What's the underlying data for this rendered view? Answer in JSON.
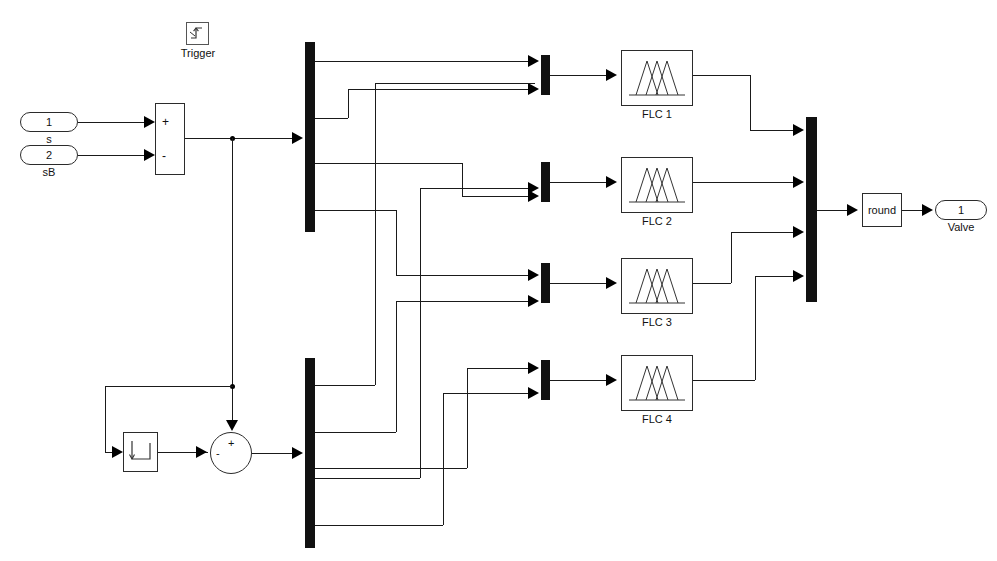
{
  "diagram": {
    "kind": "simulink-block-diagram",
    "title_fragment": "",
    "background": "#ffffff",
    "line_color": "#1a1a1a",
    "block_border": "#2b2b2b",
    "bar_color": "#111111"
  },
  "ports": {
    "inputs": [
      {
        "number": "1",
        "label": "s",
        "x": 20,
        "y": 112,
        "w": 58,
        "h": 20
      },
      {
        "number": "2",
        "label": "sB",
        "x": 20,
        "y": 145,
        "w": 58,
        "h": 20
      }
    ],
    "outputs": [
      {
        "number": "1",
        "label": "Valve",
        "x": 935,
        "y": 203,
        "w": 52,
        "h": 20
      }
    ]
  },
  "blocks": {
    "trigger": {
      "label": "Trigger",
      "x": 186,
      "y": 22,
      "w": 23,
      "h": 23
    },
    "sum_rect": {
      "x": 155,
      "y": 103,
      "w": 30,
      "h": 72,
      "signs": [
        "+",
        "-"
      ]
    },
    "unit_delay": {
      "x": 123,
      "y": 432,
      "w": 35,
      "h": 40,
      "icon": "unit-delay-icon"
    },
    "sum_circle": {
      "x": 210,
      "y": 432,
      "w": 42,
      "h": 42,
      "signs": [
        "+",
        "-"
      ]
    },
    "round": {
      "label": "round",
      "x": 862,
      "y": 193,
      "w": 40,
      "h": 34
    },
    "flc": [
      {
        "label": "FLC 1",
        "x": 621,
        "y": 50,
        "w": 72,
        "h": 56
      },
      {
        "label": "FLC 2",
        "x": 621,
        "y": 157,
        "w": 72,
        "h": 56
      },
      {
        "label": "FLC 3",
        "x": 621,
        "y": 258,
        "w": 72,
        "h": 56
      },
      {
        "label": "FLC 4",
        "x": 621,
        "y": 355,
        "w": 72,
        "h": 56
      }
    ]
  },
  "bars": {
    "demux_top": {
      "x": 305,
      "y": 42,
      "w": 10,
      "h": 190,
      "outputs": 4,
      "name": "demux-top"
    },
    "demux_bottom": {
      "x": 305,
      "y": 358,
      "w": 10,
      "h": 190,
      "outputs": 4,
      "name": "demux-bottom"
    },
    "mux_right": {
      "x": 806,
      "y": 117,
      "w": 11,
      "h": 185,
      "inputs": 4,
      "name": "mux-right"
    },
    "mux_flc": [
      {
        "x": 541,
        "y": 55,
        "w": 9,
        "h": 40,
        "inputs": 2,
        "name": "mux-flc-1"
      },
      {
        "x": 541,
        "y": 162,
        "w": 9,
        "h": 40,
        "inputs": 2,
        "name": "mux-flc-2"
      },
      {
        "x": 541,
        "y": 263,
        "w": 9,
        "h": 40,
        "inputs": 2,
        "name": "mux-flc-3"
      },
      {
        "x": 541,
        "y": 360,
        "w": 9,
        "h": 40,
        "inputs": 2,
        "name": "mux-flc-4"
      }
    ]
  },
  "annotations": {
    "membership_function_icon": "triangular-membership-functions",
    "unit_delay_icon": "unit-delay-icon",
    "trigger_icon": "rising-edge-trigger-icon"
  }
}
